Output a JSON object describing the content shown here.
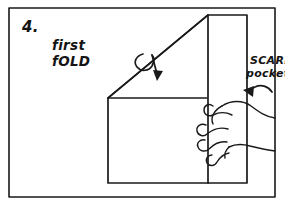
{
  "figure": {
    "step_number": "4.",
    "kind": "hand-drawn folding instruction",
    "background_color": "#ffffff",
    "ink_color": "#1a1a1a"
  },
  "labels": {
    "fold_line_1": "first",
    "fold_line_2": "fOLD",
    "pocket_line_1": "SCARF",
    "pocket_line_2": "pocket"
  },
  "icons": {
    "fold_arrow": "curved-fold-over-arrow",
    "pocket_arrow": "curved-pointer-arrow",
    "hand": "hand-holding-fabric"
  }
}
